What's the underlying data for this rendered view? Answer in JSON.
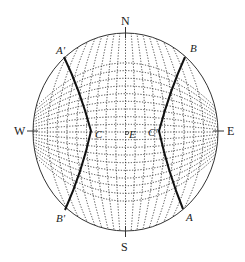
{
  "diagram": {
    "type": "stereographic projection (Wulff net) with two great circles",
    "compass": {
      "north": "N",
      "south": "S",
      "west": "W",
      "east": "E"
    },
    "great_circles": [
      {
        "name": "AA'",
        "start_label": "A",
        "end_label": "A'"
      },
      {
        "name": "BB'",
        "start_label": "B",
        "end_label": "B'"
      }
    ],
    "points": {
      "left": "C",
      "center": "E",
      "right": "C'"
    },
    "labels": {
      "a_prime": "A'",
      "b": "B",
      "b_prime": "B'",
      "a": "A"
    },
    "colors": {
      "line": "#333333",
      "background": "#ffffff"
    }
  }
}
